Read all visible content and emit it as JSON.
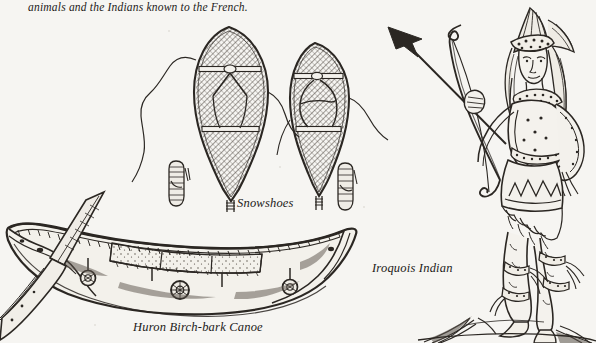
{
  "page": {
    "width": 596,
    "height": 343,
    "background_color": "#f6f5f2",
    "ink_color": "#2b2723",
    "kind": "scanned-book-illustration-plate",
    "medium": "pen-and-ink engraving reproduction"
  },
  "caption": {
    "top_text": "animals and the Indians known to the French."
  },
  "labels": {
    "snowshoes": "Snowshoes",
    "canoe": "Huron Birch-bark Canoe",
    "iroquois": "Iroquois Indian"
  },
  "figures": [
    {
      "name": "snowshoe-left",
      "label": "Snowshoes",
      "description": "large teardrop snowshoe with laced rawhide webbing and two cross-bars",
      "position": {
        "x": 189,
        "y": 25,
        "width": 80,
        "height": 180
      }
    },
    {
      "name": "snowshoe-right",
      "label": "Snowshoes",
      "description": "smaller rounded snowshoe with laced rawhide webbing and two cross-bars",
      "position": {
        "x": 280,
        "y": 40,
        "width": 72,
        "height": 170
      }
    },
    {
      "name": "moccasin-left",
      "description": "small laced moccasin boot beside the left snowshoe",
      "position": {
        "x": 172,
        "y": 160,
        "width": 18,
        "height": 48
      }
    },
    {
      "name": "moccasin-right",
      "description": "small laced moccasin boot beside the right snowshoe",
      "position": {
        "x": 338,
        "y": 162,
        "width": 18,
        "height": 50
      }
    },
    {
      "name": "huron-birch-bark-canoe",
      "label": "Huron Birch-bark Canoe",
      "description": "long birch-bark canoe with upswept ends, sewn bark seams, four thwarts and a paddle laid across the bow",
      "position": {
        "x": 0,
        "y": 190,
        "width": 370,
        "height": 130
      }
    },
    {
      "name": "paddle",
      "description": "canoe paddle crossing the bow and running off the left edge",
      "position": {
        "x": 0,
        "y": 192,
        "width": 115,
        "height": 150
      }
    },
    {
      "name": "iroquois-indian-figure",
      "label": "Iroquois Indian",
      "description": "standing Iroquois warrior drawing a bow with a nocked arrow, wearing a tall feathered headdress, beaded necklace, fringed skirt and garters, standing on grassy ground",
      "position": {
        "x": 380,
        "y": 8,
        "width": 216,
        "height": 335
      }
    },
    {
      "name": "bow-and-arrow",
      "description": "long bow held in the left hand with arrow pointing to the upper left; solid black arrowhead",
      "position": {
        "x": 388,
        "y": 18,
        "width": 125,
        "height": 180
      }
    }
  ]
}
